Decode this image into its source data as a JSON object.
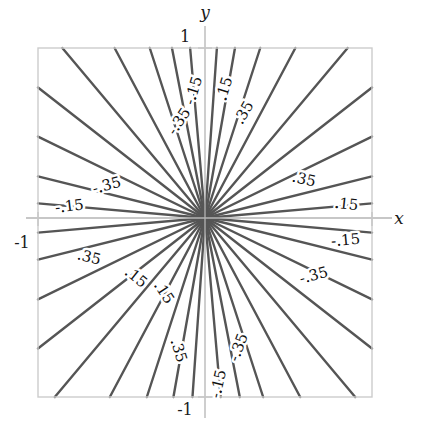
{
  "figure": {
    "kind": "contour-plot",
    "background": "#ffffff",
    "frame_color": "#cccccc",
    "axis_color": "#b4b4b4",
    "contour_color": "#555555",
    "text_color": "#1a1a1a"
  },
  "axes": {
    "x_label": "x",
    "y_label": "y",
    "x_tick_labels": [
      "-1",
      "1"
    ],
    "y_tick_labels": [
      "-1",
      "1"
    ],
    "x_min_label": "-1",
    "x_max_label": "1",
    "y_min_label": "-1",
    "y_max_label": "1"
  },
  "chart_data": {
    "type": "line",
    "title": "",
    "xlabel": "x",
    "ylabel": "y",
    "xlim": [
      -1,
      1
    ],
    "ylim": [
      -1,
      1
    ],
    "grid": false,
    "legend": "none",
    "contour_levels": [
      -0.35,
      -0.15,
      0.15,
      0.35
    ],
    "level_label_texts": [
      "-.35",
      "-.15",
      ".15",
      ".35"
    ],
    "origin": [
      0,
      0
    ],
    "rays": [
      {
        "angle_deg": 5,
        "level": 0.15
      },
      {
        "angle_deg": 14,
        "level": 0.35
      },
      {
        "angle_deg": 26,
        "level": 0.35
      },
      {
        "angle_deg": 38,
        "level": 0.35
      },
      {
        "angle_deg": 50,
        "level": 0.35
      },
      {
        "angle_deg": 62,
        "level": 0.35
      },
      {
        "angle_deg": 72,
        "level": 0.15
      },
      {
        "angle_deg": 80,
        "level": 0.15
      },
      {
        "angle_deg": 86,
        "level": 0.15
      },
      {
        "angle_deg": 95,
        "level": -0.15
      },
      {
        "angle_deg": 101,
        "level": -0.15
      },
      {
        "angle_deg": 108,
        "level": -0.15
      },
      {
        "angle_deg": 118,
        "level": -0.35
      },
      {
        "angle_deg": 130,
        "level": -0.35
      },
      {
        "angle_deg": 142,
        "level": -0.35
      },
      {
        "angle_deg": 154,
        "level": -0.35
      },
      {
        "angle_deg": 166,
        "level": -0.35
      },
      {
        "angle_deg": 175,
        "level": -0.15
      },
      {
        "angle_deg": 185,
        "level": 0.15
      },
      {
        "angle_deg": 194,
        "level": 0.35
      },
      {
        "angle_deg": 206,
        "level": 0.35
      },
      {
        "angle_deg": 218,
        "level": 0.35
      },
      {
        "angle_deg": 230,
        "level": 0.35
      },
      {
        "angle_deg": 242,
        "level": 0.35
      },
      {
        "angle_deg": 252,
        "level": 0.15
      },
      {
        "angle_deg": 260,
        "level": 0.15
      },
      {
        "angle_deg": 266,
        "level": 0.15
      },
      {
        "angle_deg": 275,
        "level": -0.15
      },
      {
        "angle_deg": 281,
        "level": -0.15
      },
      {
        "angle_deg": 288,
        "level": -0.15
      },
      {
        "angle_deg": 298,
        "level": -0.35
      },
      {
        "angle_deg": 310,
        "level": -0.35
      },
      {
        "angle_deg": 322,
        "level": -0.35
      },
      {
        "angle_deg": 334,
        "level": -0.35
      },
      {
        "angle_deg": 346,
        "level": -0.35
      },
      {
        "angle_deg": 355,
        "level": -0.15
      }
    ],
    "labels": [
      {
        "text": "-.15",
        "x_px": 198,
        "y_px": 92,
        "rot_deg": -73
      },
      {
        "text": ".15",
        "x_px": 229,
        "y_px": 90,
        "rot_deg": -73
      },
      {
        "text": "-.35",
        "x_px": 183,
        "y_px": 124,
        "rot_deg": -56
      },
      {
        "text": ".35",
        "x_px": 248,
        "y_px": 115,
        "rot_deg": -60
      },
      {
        "text": "-.35",
        "x_px": 108,
        "y_px": 190,
        "rot_deg": -15
      },
      {
        "text": "-.15",
        "x_px": 70,
        "y_px": 211,
        "rot_deg": -7
      },
      {
        "text": ".35",
        "x_px": 303,
        "y_px": 184,
        "rot_deg": 13
      },
      {
        "text": ".15",
        "x_px": 346,
        "y_px": 209,
        "rot_deg": 6
      },
      {
        "text": ".35",
        "x_px": 88,
        "y_px": 262,
        "rot_deg": 14
      },
      {
        "text": "-.15",
        "x_px": 346,
        "y_px": 245,
        "rot_deg": -5
      },
      {
        "text": "-.35",
        "x_px": 315,
        "y_px": 280,
        "rot_deg": -15
      },
      {
        "text": ".15",
        "x_px": 133,
        "y_px": 281,
        "rot_deg": 39
      },
      {
        "text": ".15",
        "x_px": 160,
        "y_px": 295,
        "rot_deg": 57
      },
      {
        "text": ".35",
        "x_px": 174,
        "y_px": 352,
        "rot_deg": 73
      },
      {
        "text": "-.35",
        "x_px": 243,
        "y_px": 349,
        "rot_deg": -70
      },
      {
        "text": "-.15",
        "x_px": 223,
        "y_px": 385,
        "rot_deg": -77
      }
    ]
  },
  "geometry": {
    "frame_left_px": 38,
    "frame_top_px": 48,
    "frame_right_px": 372,
    "frame_bottom_px": 397,
    "origin_x_px": 205,
    "origin_y_px": 218
  }
}
